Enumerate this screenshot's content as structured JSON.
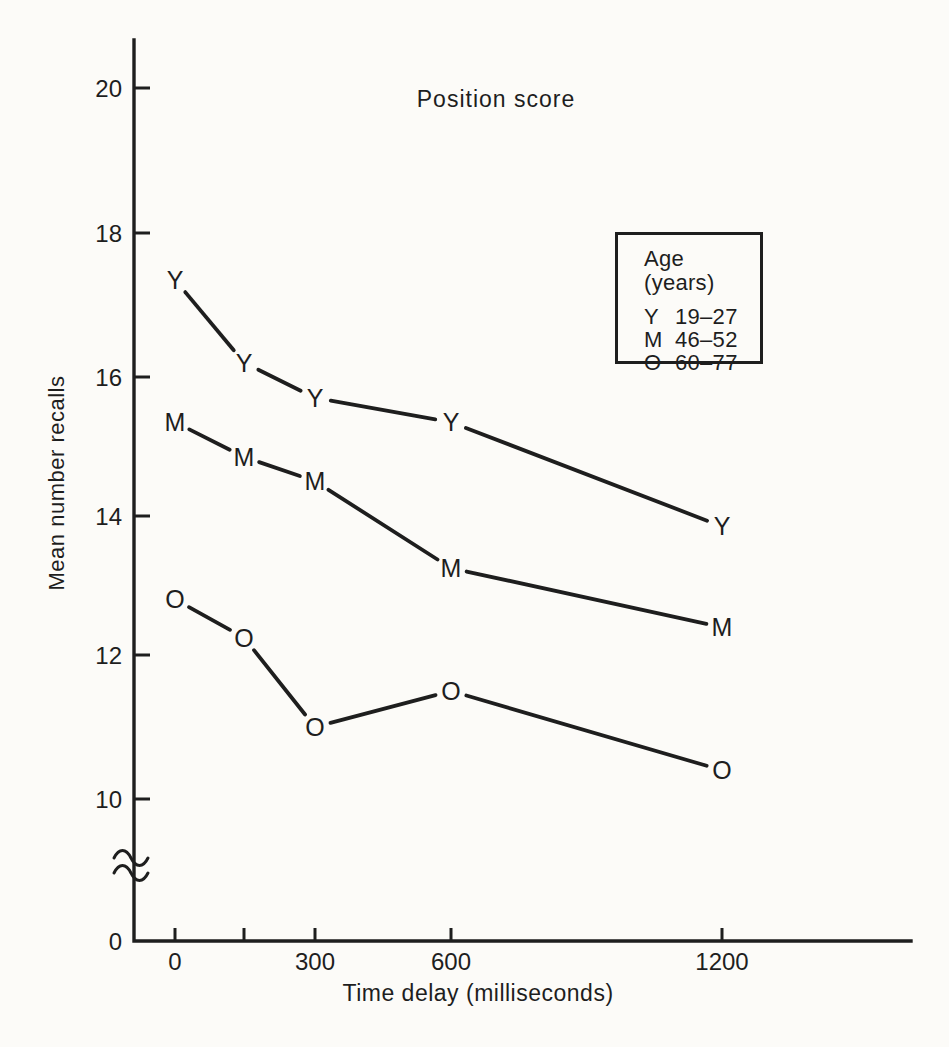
{
  "page": {
    "background": "#fcfbf8",
    "ink": "#1e1e1e"
  },
  "chart_data": {
    "type": "line",
    "title": "Position score",
    "xlabel": "Time delay (milliseconds)",
    "ylabel": "Mean number recalls",
    "x": [
      0,
      150,
      300,
      600,
      1200
    ],
    "x_ticks": {
      "values": [
        0,
        150,
        300,
        600,
        1200
      ],
      "labels": [
        "0",
        "",
        "300",
        "600",
        "1200"
      ]
    },
    "y_ticks": {
      "values": [
        20,
        18,
        16,
        14,
        12,
        10
      ],
      "labels": [
        "20",
        "18",
        "16",
        "14",
        "12",
        "10"
      ]
    },
    "y_origin_label": "0",
    "y_axis_break": true,
    "y_visible_range": [
      10,
      20.7
    ],
    "grid": false,
    "marker_style": "letter",
    "series": [
      {
        "name": "Y",
        "age_range": "19–27",
        "values": [
          17.35,
          16.2,
          15.7,
          15.35,
          13.85
        ]
      },
      {
        "name": "M",
        "age_range": "46–52",
        "values": [
          15.35,
          14.85,
          14.5,
          13.25,
          12.4
        ]
      },
      {
        "name": "O",
        "age_range": "60–77",
        "values": [
          12.8,
          12.25,
          11.0,
          11.5,
          10.4
        ]
      }
    ],
    "legend": {
      "title": "Age (years)",
      "position": "upper-right",
      "entries": [
        {
          "symbol": "Y",
          "range": "19–27"
        },
        {
          "symbol": "M",
          "range": "46–52"
        },
        {
          "symbol": "O",
          "range": "60–77"
        }
      ]
    }
  }
}
